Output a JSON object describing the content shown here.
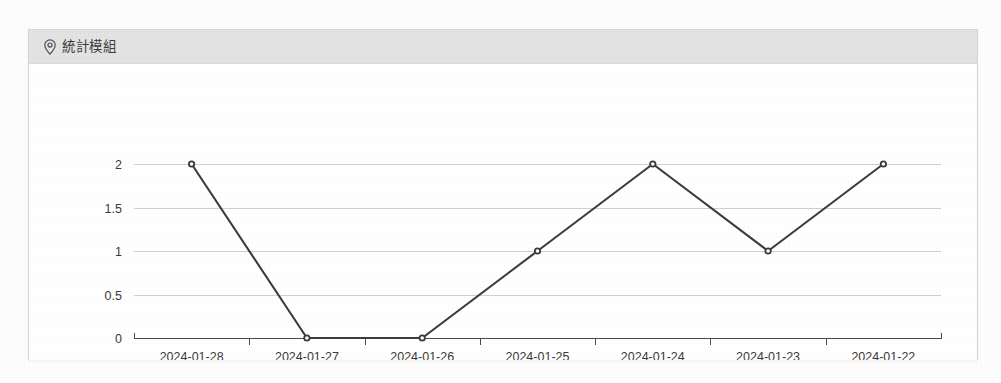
{
  "card": {
    "header": {
      "icon": "map-pin-icon",
      "title": "統計模組"
    }
  },
  "chart_data": {
    "type": "line",
    "title": "",
    "subtitle": "",
    "xlabel": "",
    "ylabel": "",
    "categories": [
      "2024-01-28",
      "2024-01-27",
      "2024-01-26",
      "2024-01-25",
      "2024-01-24",
      "2024-01-23",
      "2024-01-22"
    ],
    "values": [
      2,
      0,
      0,
      1,
      2,
      1,
      2
    ],
    "series": [
      {
        "name": "",
        "values": [
          2,
          0,
          0,
          1,
          2,
          1,
          2
        ]
      }
    ],
    "ylim": [
      0,
      2
    ],
    "yticks": [
      0,
      0.5,
      1,
      1.5,
      2
    ],
    "ytick_labels": [
      "0",
      "0.5",
      "1",
      "1.5",
      "2"
    ],
    "xtick_labels": [
      "2024-01-28",
      "2024-01-27",
      "2024-01-26",
      "2024-01-25",
      "2024-01-24",
      "2024-01-23",
      "2024-01-22"
    ],
    "grid": true,
    "grid_axis": "y",
    "legend": false,
    "legend_position": "none",
    "marker": "circle",
    "line_color": "#3c3c3c",
    "grid_color": "#cfcfcf",
    "axis_color": "#4a4a4a",
    "marker_fill": "#ffffff"
  },
  "colors": {
    "card_background": "#ffffff",
    "card_border": "#d6d6d6",
    "header_background": "#e3e3e3",
    "header_text": "#3b3b3b",
    "page_background": "#fdfdfd"
  }
}
